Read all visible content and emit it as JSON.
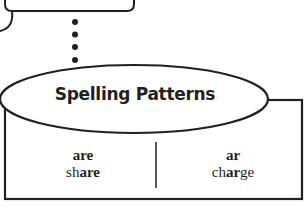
{
  "diagram": {
    "title": "Spelling Patterns",
    "columns": [
      {
        "pattern": "are",
        "word_prefix": "sh",
        "word_pattern": "are",
        "word_suffix": ""
      },
      {
        "pattern": "ar",
        "word_prefix": "ch",
        "word_pattern": "ar",
        "word_suffix": "ge"
      }
    ],
    "connector": {
      "type": "dotted",
      "dot_count": 4
    },
    "colors": {
      "stroke": "#231f20",
      "background": "#ffffff"
    }
  }
}
